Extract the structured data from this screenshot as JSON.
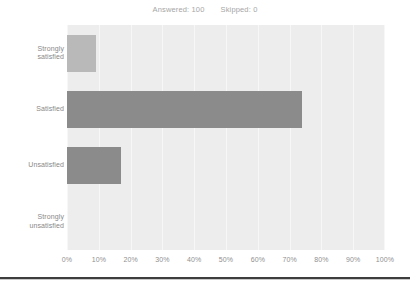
{
  "header": {
    "answered_label": "Answered: 100",
    "skipped_label": "Skipped: 0"
  },
  "colors": {
    "plot_background": "#ededed",
    "gridline": "#f7f7f7",
    "bar_light": "#b9b9b9",
    "bar_dark": "#8b8b8b",
    "text": "#8e8e8e",
    "rule": "#3d3d3d"
  },
  "chart_data": {
    "type": "bar",
    "orientation": "horizontal",
    "title": "",
    "subtitle": "",
    "xlabel": "",
    "ylabel": "",
    "xlim": [
      0,
      100
    ],
    "grid": true,
    "legend": "none",
    "categories": [
      "Strongly satisfied",
      "Satisfied",
      "Unsatisfied",
      "Strongly unsatisfied"
    ],
    "category_lines": [
      [
        "Strongly",
        "satisfied"
      ],
      [
        "Satisfied"
      ],
      [
        "Unsatisfied"
      ],
      [
        "Strongly",
        "unsatisfied"
      ]
    ],
    "values": [
      9,
      74,
      17,
      0
    ],
    "value_unit": "%",
    "bar_colors": [
      "#b9b9b9",
      "#8b8b8b",
      "#8b8b8b",
      "#8b8b8b"
    ],
    "xticks": [
      0,
      10,
      20,
      30,
      40,
      50,
      60,
      70,
      80,
      90,
      100
    ],
    "xticklabels": [
      "0%",
      "10%",
      "20%",
      "30%",
      "40%",
      "50%",
      "60%",
      "70%",
      "80%",
      "90%",
      "100%"
    ]
  }
}
